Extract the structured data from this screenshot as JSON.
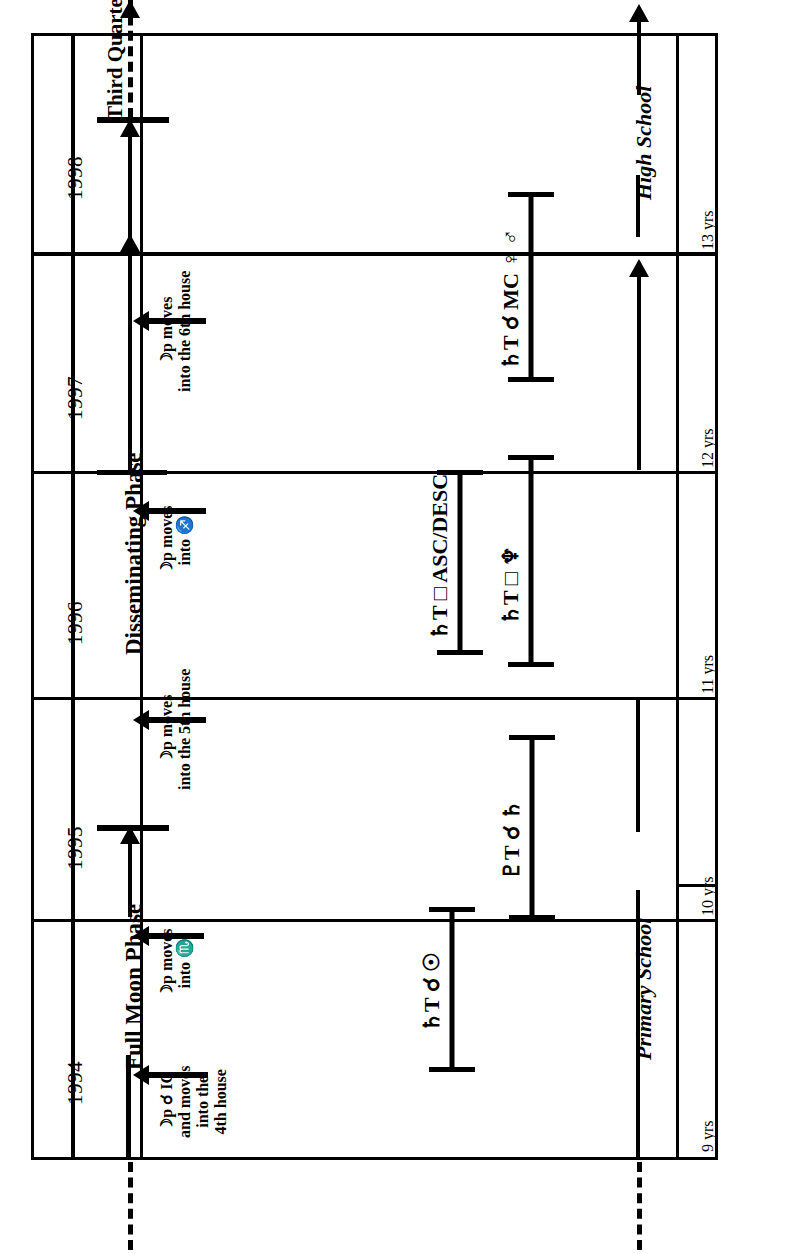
{
  "diagram": {
    "orientation": "rotated-90-ccw",
    "years": [
      "1994",
      "1995",
      "1996",
      "1997",
      "1998"
    ],
    "ages": [
      "9 yrs",
      "10 yrs",
      "11 yrs",
      "12 yrs",
      "13 yrs"
    ],
    "schooling": [
      {
        "label": "Primary School"
      },
      {
        "label": "High School"
      }
    ],
    "lunar_phases": [
      {
        "label": "Full Moon Phase"
      },
      {
        "label": "Disseminating Phase"
      },
      {
        "label": "Third Quarter Phase"
      }
    ],
    "progressions": [
      {
        "line1": "☽p ☌ IC",
        "line2": "and moves",
        "line3": "into the",
        "line4": "4th house"
      },
      {
        "line1": "☽p moves",
        "line2": "into ♏"
      },
      {
        "line1": "☽p moves",
        "line2": "into the 5th house"
      },
      {
        "line1": "☽p moves",
        "line2": "into ♐"
      },
      {
        "line1": "☽p moves",
        "line2": "into the 6th house"
      }
    ],
    "transits": [
      {
        "label": "♄T ☌ ☉",
        "planet": "♄",
        "sub": "T",
        "aspect": "☌",
        "target": "☉"
      },
      {
        "label": "♇T ☌ ♄",
        "planet": "♇",
        "sub": "T",
        "aspect": "☌",
        "target": "♄"
      },
      {
        "label": "♄T □ ASC/DESC",
        "planet": "♄",
        "sub": "T",
        "aspect": "□",
        "target": "ASC/DESC"
      },
      {
        "label": "♄T □ ♆",
        "planet": "♄",
        "sub": "T",
        "aspect": "□",
        "target": "♆"
      },
      {
        "label": "♄T ☌ MC ♀ ♂",
        "planet": "♄",
        "sub": "T",
        "aspect": "☌",
        "target": "MC ♀ ♂"
      }
    ],
    "colors": {
      "ink": "#000000",
      "paper": "#ffffff"
    }
  }
}
